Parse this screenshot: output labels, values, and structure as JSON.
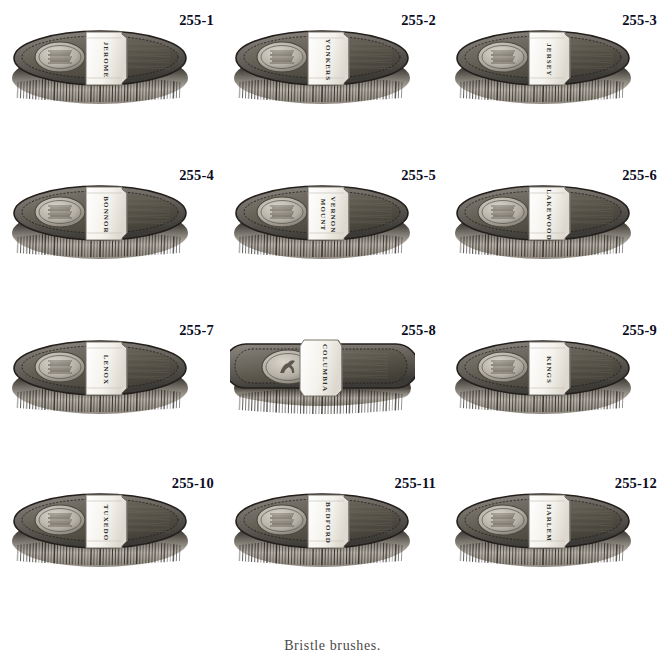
{
  "page": {
    "caption": "Bristle brushes.",
    "background_color": "#ffffff",
    "text_color": "#0d0d1f"
  },
  "colors": {
    "body_dark": "#3c3a36",
    "body_mid": "#6a665f",
    "body_light": "#8d8880",
    "rim_dark": "#241f1c",
    "bristle_dark": "#2b2824",
    "bristle_light": "#b9b3aa",
    "label_white": "#f4f2ec",
    "emblem_silver": "#b5b0a6",
    "number_color": "#0d0d1f"
  },
  "items": [
    {
      "number": "255-1",
      "name": "JEROME",
      "shape": "oval",
      "emblem": "crest",
      "label_lines": [
        "JEROME"
      ]
    },
    {
      "number": "255-2",
      "name": "YONKERS",
      "shape": "oval",
      "emblem": "crest",
      "label_lines": [
        "YONKERS"
      ]
    },
    {
      "number": "255-3",
      "name": "JERSEY",
      "shape": "oval",
      "emblem": "crest",
      "label_lines": [
        "JERSEY"
      ]
    },
    {
      "number": "255-4",
      "name": "BONNOR",
      "shape": "oval",
      "emblem": "crest",
      "label_lines": [
        "BONNOR"
      ]
    },
    {
      "number": "255-5",
      "name": "MOUNT VERNON",
      "shape": "oval",
      "emblem": "crest",
      "label_lines": [
        "MOUNT",
        "VERNON"
      ]
    },
    {
      "number": "255-6",
      "name": "LAKEWOOD",
      "shape": "oval",
      "emblem": "crest",
      "label_lines": [
        "LAKEWOOD"
      ]
    },
    {
      "number": "255-7",
      "name": "LENOX",
      "shape": "oval",
      "emblem": "crest",
      "label_lines": [
        "LENOX"
      ]
    },
    {
      "number": "255-8",
      "name": "COLUMBIA",
      "shape": "rectangle",
      "emblem": "horse",
      "label_lines": [
        "COLUMBIA"
      ]
    },
    {
      "number": "255-9",
      "name": "KINGS",
      "shape": "oval",
      "emblem": "crest",
      "label_lines": [
        "KINGS"
      ]
    },
    {
      "number": "255-10",
      "name": "TUXEDO",
      "shape": "oval",
      "emblem": "crest",
      "label_lines": [
        "TUXEDO"
      ]
    },
    {
      "number": "255-11",
      "name": "BEDFORD",
      "shape": "oval",
      "emblem": "crest",
      "label_lines": [
        "BEDFORD"
      ]
    },
    {
      "number": "255-12",
      "name": "HARLEM",
      "shape": "oval",
      "emblem": "crest",
      "label_lines": [
        "HARLEM"
      ]
    }
  ]
}
